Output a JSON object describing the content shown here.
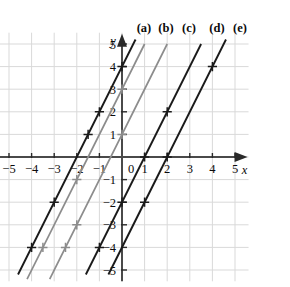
{
  "chart_data": {
    "type": "line",
    "title": "",
    "xlabel": "x",
    "ylabel": "y",
    "xlim": [
      -5.6,
      5.6
    ],
    "ylim": [
      -5.5,
      5.5
    ],
    "grid": true,
    "grid_step": 1,
    "legend_position": "top-inside",
    "x_ticks": [
      -5,
      -4,
      -3,
      -2,
      -1,
      0,
      1,
      2,
      3,
      4,
      5
    ],
    "x_tick_labels": [
      "−5",
      "−4",
      "−3",
      "−2",
      "−1",
      "0",
      "1",
      "2",
      "3",
      "4",
      "5"
    ],
    "y_ticks": [
      -5,
      -4,
      -3,
      -2,
      -1,
      1,
      2,
      3,
      4,
      5
    ],
    "y_tick_labels": [
      "−5",
      "−4",
      "−3",
      "−2",
      "−1",
      "1",
      "2",
      "3",
      "4",
      "5"
    ],
    "common_slope": 2,
    "series": [
      {
        "name": "(a)",
        "label": "(a)",
        "slope": 2,
        "intercept": 4,
        "color": "#1a1a1a",
        "width": 1.9,
        "x_intercept": -2,
        "markers": [
          [
            -4,
            -4
          ],
          [
            -3,
            -2
          ],
          [
            -1,
            2
          ],
          [
            -1.5,
            1
          ],
          [
            0,
            4
          ]
        ],
        "x_from": -4.6,
        "x_to": 0.6
      },
      {
        "name": "(b)",
        "label": "(b)",
        "slope": 2,
        "intercept": 3,
        "color": "#8c8c8c",
        "width": 1.7,
        "x_intercept": -1.5,
        "markers": [
          [
            -3.5,
            -4
          ],
          [
            -2,
            -1
          ],
          [
            0,
            3
          ]
        ],
        "x_from": -4.2,
        "x_to": 1.0
      },
      {
        "name": "(c)",
        "label": "(c)",
        "slope": 2,
        "intercept": 1,
        "color": "#8c8c8c",
        "width": 1.7,
        "x_intercept": -0.5,
        "markers": [
          [
            -2.5,
            -4
          ],
          [
            -2,
            -3
          ],
          [
            0,
            1
          ]
        ],
        "x_from": -3.2,
        "x_to": 2.0
      },
      {
        "name": "(d)",
        "label": "(d)",
        "slope": 2,
        "intercept": -2,
        "color": "#1a1a1a",
        "width": 1.9,
        "x_intercept": 1,
        "markers": [
          [
            -1,
            -4
          ],
          [
            0,
            -2
          ],
          [
            1,
            0
          ],
          [
            2,
            2
          ]
        ],
        "x_from": -1.6,
        "x_to": 3.5
      },
      {
        "name": "(e)",
        "label": "(e)",
        "slope": 2,
        "intercept": -4,
        "color": "#1a1a1a",
        "width": 1.9,
        "x_intercept": 2,
        "markers": [
          [
            1,
            -2
          ],
          [
            2,
            0
          ],
          [
            4,
            4
          ]
        ],
        "x_from": -0.6,
        "x_to": 4.6
      }
    ],
    "label_positions": [
      {
        "label": "(a)",
        "x": 144,
        "y": 32
      },
      {
        "label": "(b)",
        "x": 166,
        "y": 32
      },
      {
        "label": "(c)",
        "x": 189,
        "y": 32
      },
      {
        "label": "(d)",
        "x": 217,
        "y": 32
      },
      {
        "label": "(e)",
        "x": 240,
        "y": 32
      }
    ]
  },
  "axes": {
    "x_axis_name": "x",
    "y_axis_name": "y",
    "origin_label": "0"
  }
}
